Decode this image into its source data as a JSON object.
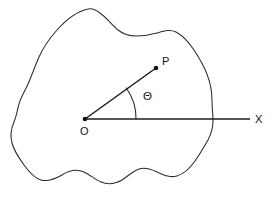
{
  "figure": {
    "background_color": "#ffffff",
    "stroke_color": "#2b2b2b",
    "label_color": "#141414",
    "width": 274,
    "height": 199
  },
  "labels": {
    "origin": "O",
    "point": "P",
    "axis": "X",
    "angle": "Θ"
  },
  "geometry": {
    "origin": {
      "x": 85,
      "y": 119
    },
    "point_p": {
      "x": 156,
      "y": 68
    },
    "axis_end": {
      "x": 250,
      "y": 119
    },
    "arc_radius": 51,
    "angle_degrees": 36
  },
  "elements": {
    "region_name": "closed-region-boundary",
    "axis_name": "x-axis",
    "radius_name": "radius-vector-op",
    "arc_name": "angle-arc"
  }
}
